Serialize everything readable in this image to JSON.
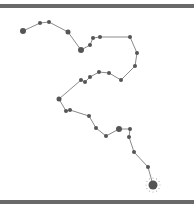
{
  "canvas": {
    "width": 194,
    "height": 208,
    "background": "#ffffff",
    "border_color": "#6a6a6a"
  },
  "path": {
    "line_color": "#8a8a8a",
    "point_color": "#555555",
    "points": [
      {
        "x": 23,
        "y": 31,
        "r": 3
      },
      {
        "x": 40,
        "y": 23,
        "r": 2
      },
      {
        "x": 49,
        "y": 22,
        "r": 2
      },
      {
        "x": 68,
        "y": 32,
        "r": 2.5
      },
      {
        "x": 81,
        "y": 50,
        "r": 3
      },
      {
        "x": 90,
        "y": 45,
        "r": 2
      },
      {
        "x": 93,
        "y": 38,
        "r": 2
      },
      {
        "x": 100,
        "y": 37,
        "r": 2
      },
      {
        "x": 130,
        "y": 37,
        "r": 2
      },
      {
        "x": 137,
        "y": 53,
        "r": 2
      },
      {
        "x": 135,
        "y": 66,
        "r": 2
      },
      {
        "x": 121,
        "y": 80,
        "r": 2
      },
      {
        "x": 109,
        "y": 73,
        "r": 2
      },
      {
        "x": 99,
        "y": 72,
        "r": 2
      },
      {
        "x": 90,
        "y": 77,
        "r": 2
      },
      {
        "x": 85,
        "y": 82,
        "r": 2
      },
      {
        "x": 81,
        "y": 80,
        "r": 2
      },
      {
        "x": 59,
        "y": 99,
        "r": 2.5
      },
      {
        "x": 66,
        "y": 111,
        "r": 2
      },
      {
        "x": 70,
        "y": 110,
        "r": 2
      },
      {
        "x": 89,
        "y": 116,
        "r": 2
      },
      {
        "x": 96,
        "y": 128,
        "r": 2
      },
      {
        "x": 106,
        "y": 136,
        "r": 2
      },
      {
        "x": 119,
        "y": 129,
        "r": 3
      },
      {
        "x": 130,
        "y": 129,
        "r": 2
      },
      {
        "x": 129,
        "y": 137,
        "r": 2
      },
      {
        "x": 134,
        "y": 152,
        "r": 2
      },
      {
        "x": 148,
        "y": 167,
        "r": 2
      },
      {
        "x": 153,
        "y": 185,
        "r": 4.5
      }
    ],
    "end_marker": {
      "x": 153,
      "y": 185,
      "halo_r": 7
    }
  }
}
